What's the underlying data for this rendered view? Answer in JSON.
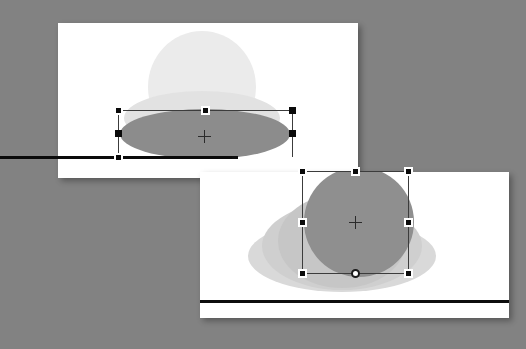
{
  "app": {
    "name": "presentation-editor",
    "view": "slide-canvas",
    "background_color": "#828282"
  },
  "canvas": {
    "width": 526,
    "height": 349
  },
  "slides": [
    {
      "id": "slide-1",
      "label": "Slide 1",
      "x": 58,
      "y": 23,
      "width": 300,
      "height": 155,
      "background_color": "#ffffff",
      "rule": {
        "x": 0,
        "y": 133,
        "width": 180,
        "height": 3,
        "color": "#0d0d0d"
      },
      "shapes": [
        {
          "name": "background-dome",
          "type": "ellipse",
          "x": 90,
          "y": 8,
          "width": 108,
          "height": 112,
          "color": "#ebebeb"
        },
        {
          "name": "soft-ellipse",
          "type": "ellipse",
          "x": 66,
          "y": 68,
          "width": 156,
          "height": 54,
          "color": "#e2e2e2"
        },
        {
          "name": "selected-ellipse",
          "type": "ellipse",
          "x": 62,
          "y": 86,
          "width": 170,
          "height": 50,
          "color": "#8c8c8c"
        }
      ],
      "selection": {
        "name": "selection-frame-ellipse",
        "x": 60,
        "y": 87,
        "width": 174,
        "height": 47,
        "handles": [
          "top-left",
          "top-center",
          "top-right",
          "middle-left",
          "middle-right",
          "bottom-left"
        ],
        "cursor": {
          "type": "crosshair",
          "x": 146,
          "y": 113
        }
      }
    },
    {
      "id": "slide-2",
      "label": "Slide 2",
      "x": 200,
      "y": 172,
      "width": 309,
      "height": 146,
      "background_color": "#ffffff",
      "rule": {
        "x": 0,
        "y": 128,
        "width": 309,
        "height": 3,
        "color": "#0d0d0d"
      },
      "shapes": [
        {
          "name": "soft-ellipse-wide",
          "type": "ellipse",
          "x": 48,
          "y": 48,
          "width": 188,
          "height": 72,
          "color": "#d9d9d9"
        },
        {
          "name": "soft-ellipse-mid",
          "type": "ellipse",
          "x": 62,
          "y": 30,
          "width": 160,
          "height": 88,
          "color": "#cfcfcf"
        },
        {
          "name": "soft-ellipse-inner",
          "type": "ellipse",
          "x": 78,
          "y": 22,
          "width": 128,
          "height": 94,
          "color": "#c6c6c6"
        },
        {
          "name": "selected-circle",
          "type": "ellipse",
          "x": 104,
          "y": -5,
          "width": 110,
          "height": 110,
          "color": "#8f8f8f"
        }
      ],
      "selection": {
        "name": "selection-frame-circle",
        "x": 102,
        "y": -1,
        "width": 106,
        "height": 102,
        "handles": [
          "top-left",
          "top-center",
          "top-right",
          "middle-left",
          "middle-right",
          "bottom-left",
          "bottom-center-rotate",
          "bottom-right"
        ],
        "cursor": {
          "type": "crosshair",
          "x": 155,
          "y": 50
        }
      }
    }
  ],
  "colors": {
    "desktop": "#828282",
    "slide": "#ffffff",
    "handle_fill": "#0a0a0a",
    "handle_border": "#ffffff",
    "selection_line": "#3c3c3c",
    "rule": "#0d0d0d"
  }
}
